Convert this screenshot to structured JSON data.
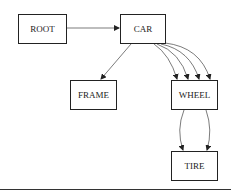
{
  "diagram": {
    "nodes": [
      {
        "id": "root",
        "label": "ROOT",
        "x": 18,
        "y": 14,
        "w": 49,
        "h": 30
      },
      {
        "id": "car",
        "label": "CAR",
        "x": 120,
        "y": 14,
        "w": 46,
        "h": 30
      },
      {
        "id": "frame",
        "label": "FRAME",
        "x": 70,
        "y": 80,
        "w": 47,
        "h": 30
      },
      {
        "id": "wheel",
        "label": "WHEEL",
        "x": 171,
        "y": 80,
        "w": 47,
        "h": 30
      },
      {
        "id": "tire",
        "label": "TIRE",
        "x": 171,
        "y": 151,
        "w": 47,
        "h": 30
      }
    ],
    "edges": [
      {
        "from": "root",
        "to": "car",
        "count": 1
      },
      {
        "from": "car",
        "to": "frame",
        "count": 1
      },
      {
        "from": "car",
        "to": "wheel",
        "count": 4
      },
      {
        "from": "wheel",
        "to": "tire",
        "count": 2
      }
    ],
    "colors": {
      "stroke": "#222222",
      "background": "#ffffff"
    }
  }
}
